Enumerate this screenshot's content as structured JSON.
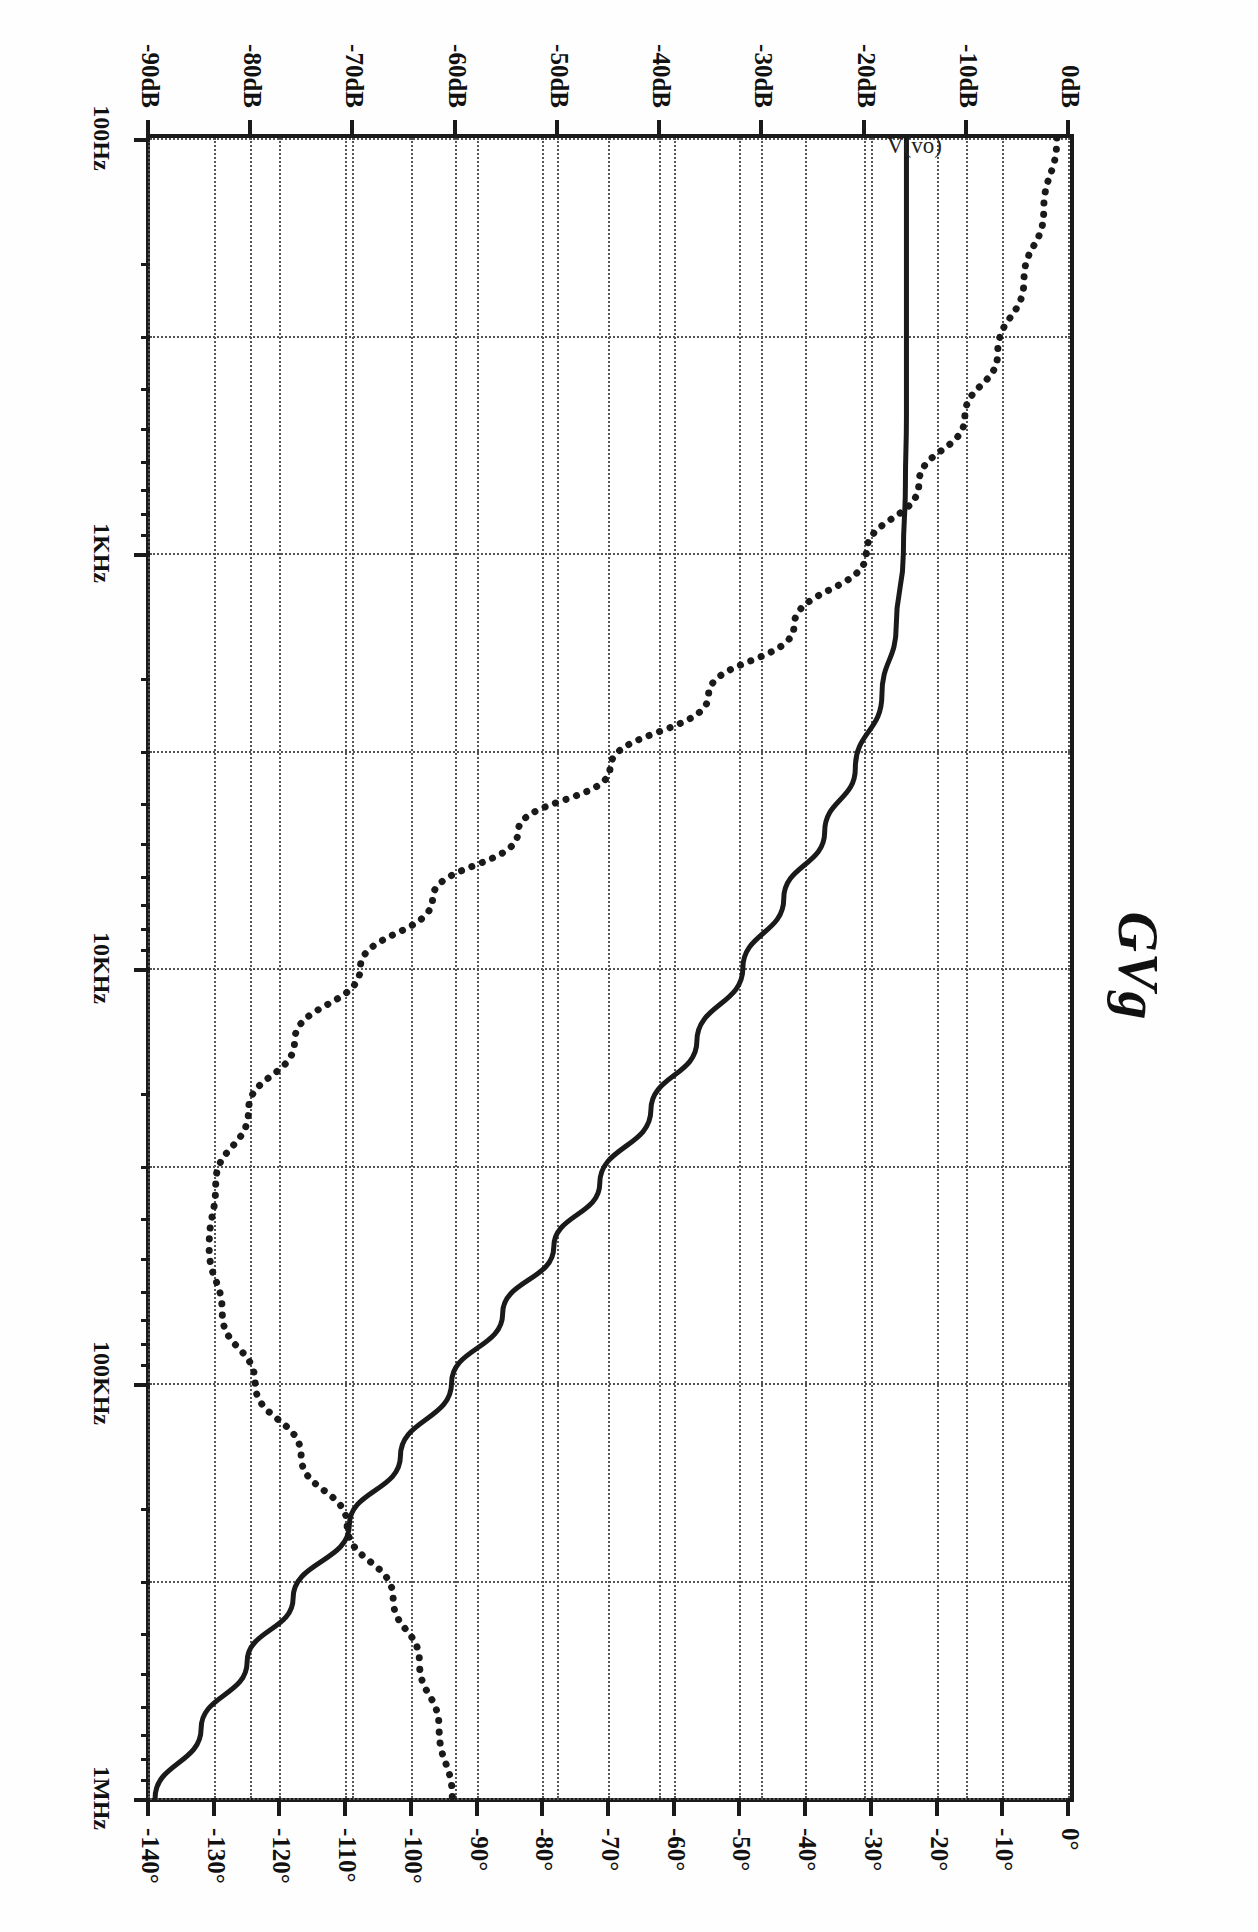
{
  "chart_data": {
    "type": "line",
    "title": "GVg",
    "trace_label": "V(vo)",
    "xlabel": "",
    "ylabel": "",
    "orientation": "rotated-90-clockwise",
    "grid": true,
    "legend": "none",
    "x_axis": {
      "name": "frequency",
      "scale": "log",
      "unit": "Hz",
      "range": [
        100,
        1000000
      ],
      "tick_labels": [
        "100Hz",
        "1KHz",
        "10KHz",
        "100KHz",
        "1MHz"
      ],
      "tick_values": [
        100,
        1000,
        10000,
        100000,
        1000000
      ],
      "minor_ticks_per_decade": 9
    },
    "y_axis_left": {
      "name": "magnitude",
      "unit": "dB",
      "range": [
        -90,
        0
      ],
      "tick_labels": [
        "0dB",
        "-10dB",
        "-20dB",
        "-30dB",
        "-40dB",
        "-50dB",
        "-60dB",
        "-70dB",
        "-80dB",
        "-90dB"
      ],
      "tick_values": [
        0,
        -10,
        -20,
        -30,
        -40,
        -50,
        -60,
        -70,
        -80,
        -90
      ]
    },
    "y_axis_right": {
      "name": "phase",
      "unit": "degrees",
      "range": [
        -140,
        0
      ],
      "tick_labels": [
        "0°",
        "-10°",
        "-20°",
        "-30°",
        "-40°",
        "-50°",
        "-60°",
        "-70°",
        "-80°",
        "-90°",
        "-100°",
        "-110°",
        "-120°",
        "-130°",
        "-140°"
      ],
      "tick_values": [
        0,
        -10,
        -20,
        -30,
        -40,
        -50,
        -60,
        -70,
        -80,
        -90,
        -100,
        -110,
        -120,
        -130,
        -140
      ]
    },
    "series": [
      {
        "name": "magnitude",
        "style": "solid",
        "color": "#1a1a1a",
        "axis": "left",
        "unit": "dB",
        "x": [
          100,
          150,
          220,
          330,
          470,
          680,
          1000,
          1500,
          2200,
          3300,
          4700,
          6800,
          10000,
          15000,
          22000,
          33000,
          47000,
          68000,
          100000,
          150000,
          220000,
          330000,
          470000,
          680000,
          1000000
        ],
        "values": [
          -16.0,
          -16.0,
          -16.0,
          -16.0,
          -16.0,
          -16.1,
          -16.3,
          -17.0,
          -18.4,
          -21.0,
          -24.0,
          -28.0,
          -32.0,
          -36.5,
          -41.0,
          -46.0,
          -50.5,
          -55.5,
          -60.5,
          -65.5,
          -70.5,
          -76.0,
          -80.5,
          -85.0,
          -89.5
        ]
      },
      {
        "name": "phase",
        "style": "dotted",
        "color": "#1a1a1a",
        "axis": "right",
        "unit": "degrees",
        "x": [
          100,
          150,
          220,
          330,
          470,
          680,
          1000,
          1500,
          2200,
          3300,
          4700,
          6800,
          10000,
          15000,
          22000,
          33000,
          47000,
          68000,
          100000,
          150000,
          220000,
          330000,
          470000,
          680000,
          1000000
        ],
        "values": [
          -2.0,
          -4.0,
          -7.0,
          -11.0,
          -16.0,
          -23.0,
          -31.0,
          -42.0,
          -55.0,
          -70.0,
          -84.0,
          -97.0,
          -108.0,
          -118.0,
          -125.0,
          -130.0,
          -131.0,
          -129.0,
          -124.0,
          -117.0,
          -110.0,
          -103.0,
          -99.0,
          -96.0,
          -94.0
        ]
      }
    ]
  }
}
